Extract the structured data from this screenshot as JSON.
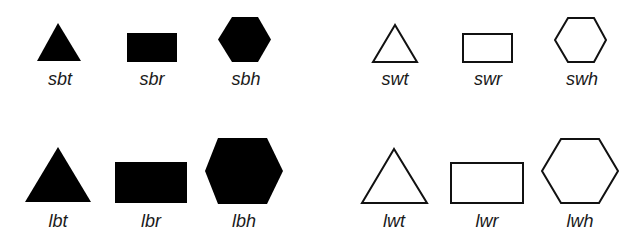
{
  "colors": {
    "fill": "#000000",
    "stroke": "#111111",
    "background": "#ffffff"
  },
  "shapes": [
    {
      "id": "sbt",
      "label": "sbt",
      "size": "small",
      "fill": "black",
      "shape": "triangle"
    },
    {
      "id": "sbr",
      "label": "sbr",
      "size": "small",
      "fill": "black",
      "shape": "rectangle"
    },
    {
      "id": "sbh",
      "label": "sbh",
      "size": "small",
      "fill": "black",
      "shape": "hexagon"
    },
    {
      "id": "swt",
      "label": "swt",
      "size": "small",
      "fill": "white",
      "shape": "triangle"
    },
    {
      "id": "swr",
      "label": "swr",
      "size": "small",
      "fill": "white",
      "shape": "rectangle"
    },
    {
      "id": "swh",
      "label": "swh",
      "size": "small",
      "fill": "white",
      "shape": "hexagon"
    },
    {
      "id": "lbt",
      "label": "lbt",
      "size": "large",
      "fill": "black",
      "shape": "triangle"
    },
    {
      "id": "lbr",
      "label": "lbr",
      "size": "large",
      "fill": "black",
      "shape": "rectangle"
    },
    {
      "id": "lbh",
      "label": "lbh",
      "size": "large",
      "fill": "black",
      "shape": "hexagon"
    },
    {
      "id": "lwt",
      "label": "lwt",
      "size": "large",
      "fill": "white",
      "shape": "triangle"
    },
    {
      "id": "lwr",
      "label": "lwr",
      "size": "large",
      "fill": "white",
      "shape": "rectangle"
    },
    {
      "id": "lwh",
      "label": "lwh",
      "size": "large",
      "fill": "white",
      "shape": "hexagon"
    }
  ]
}
